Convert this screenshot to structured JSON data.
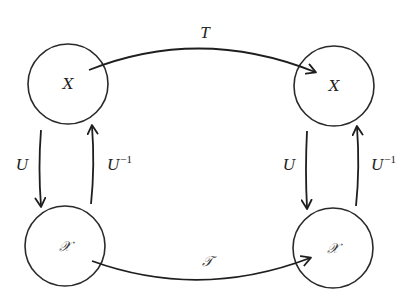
{
  "diagram": {
    "type": "commutative-diagram",
    "nodes": [
      {
        "id": "top-left",
        "label": "X",
        "style": "italic",
        "cx": 68,
        "cy": 84,
        "r": 40
      },
      {
        "id": "top-right",
        "label": "X",
        "style": "italic",
        "cx": 334,
        "cy": 86,
        "r": 40
      },
      {
        "id": "bottom-left",
        "label": "𝒳",
        "style": "script",
        "cx": 65,
        "cy": 246,
        "r": 40
      },
      {
        "id": "bottom-right",
        "label": "𝒳",
        "style": "script",
        "cx": 333,
        "cy": 248,
        "r": 40
      }
    ],
    "edges": [
      {
        "id": "T",
        "from": "top-left",
        "to": "top-right",
        "label": "T"
      },
      {
        "id": "script-T",
        "from": "bottom-left",
        "to": "bottom-right",
        "label": "𝒯"
      },
      {
        "id": "U-left",
        "from": "top-left",
        "to": "bottom-left",
        "label": "U"
      },
      {
        "id": "U-inverse-left",
        "from": "bottom-left",
        "to": "top-left",
        "label": "U",
        "superscript": "−1"
      },
      {
        "id": "U-right",
        "from": "top-right",
        "to": "bottom-right",
        "label": "U"
      },
      {
        "id": "U-inverse-right",
        "from": "bottom-right",
        "to": "top-right",
        "label": "U",
        "superscript": "−1"
      }
    ]
  },
  "labels": {
    "top_left_node": "X",
    "top_right_node": "X",
    "bottom_left_node": "𝒳",
    "bottom_right_node": "𝒳",
    "top_edge": "T",
    "bottom_edge": "𝒯",
    "left_down": "U",
    "left_up": "U",
    "left_up_sup": "−1",
    "right_down": "U",
    "right_up": "U",
    "right_up_sup": "−1"
  },
  "colors": {
    "stroke": "#1e1e1e",
    "background": "#ffffff"
  }
}
